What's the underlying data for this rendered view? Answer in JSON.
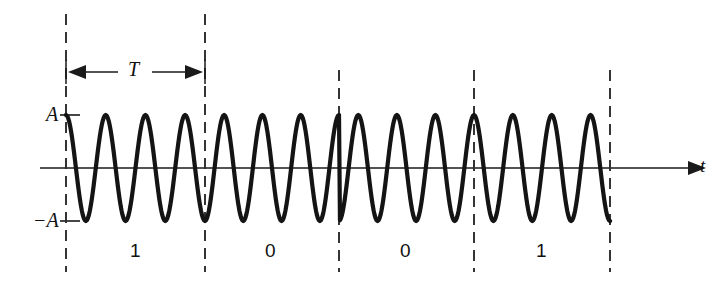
{
  "figure": {
    "name": "bpsk-waveform",
    "width": 721,
    "height": 285,
    "background": "#ffffff",
    "stroke_color": "#141414"
  },
  "labels": {
    "amplitude_positive": "A",
    "amplitude_negative": "−A",
    "period": "T",
    "time_axis": "t"
  },
  "bits": [
    {
      "value": "1",
      "label_x": 135
    },
    {
      "value": "0",
      "label_x": 271
    },
    {
      "value": "0",
      "label_x": 406
    },
    {
      "value": "1",
      "label_x": 541
    }
  ],
  "chart_data": {
    "type": "line",
    "title": "",
    "xlabel": "t",
    "ylabel": "",
    "grid": false,
    "legend": null,
    "annotations": [
      {
        "text": "A",
        "kind": "y-tick",
        "value": 1
      },
      {
        "text": "−A",
        "kind": "y-tick",
        "value": -1
      },
      {
        "text": "T",
        "kind": "dimension",
        "from_x": 66,
        "to_x": 205
      },
      {
        "text": "t",
        "kind": "axis-arrow-label"
      }
    ],
    "modulation": "BPSK",
    "bit_sequence": [
      "1",
      "0",
      "0",
      "1"
    ],
    "bit_phases_deg": [
      0,
      180,
      180,
      0
    ],
    "cycles_per_bit": 3.5,
    "amplitude": 1,
    "ylim": [
      -1.25,
      1.25
    ],
    "boundaries_px": [
      66,
      205,
      339,
      474,
      610
    ],
    "baseline_y_px": 168,
    "peak_y_px": 115,
    "trough_y_px": 221,
    "series": [
      {
        "name": "BPSK modulated carrier",
        "description": "Sinusoidal carrier of amplitude A whose phase reverses by 180 degrees at each 1-to-0 and 0-to-1 bit transition"
      }
    ]
  },
  "geometry": {
    "axis_y": 168,
    "axis_x_start": 40,
    "axis_x_end": 690,
    "divider_top": 14,
    "divider_bottom": 272,
    "short_divider_top": 70,
    "dimension_y": 72,
    "tick_pos_y": 115,
    "tick_neg_y": 221
  }
}
